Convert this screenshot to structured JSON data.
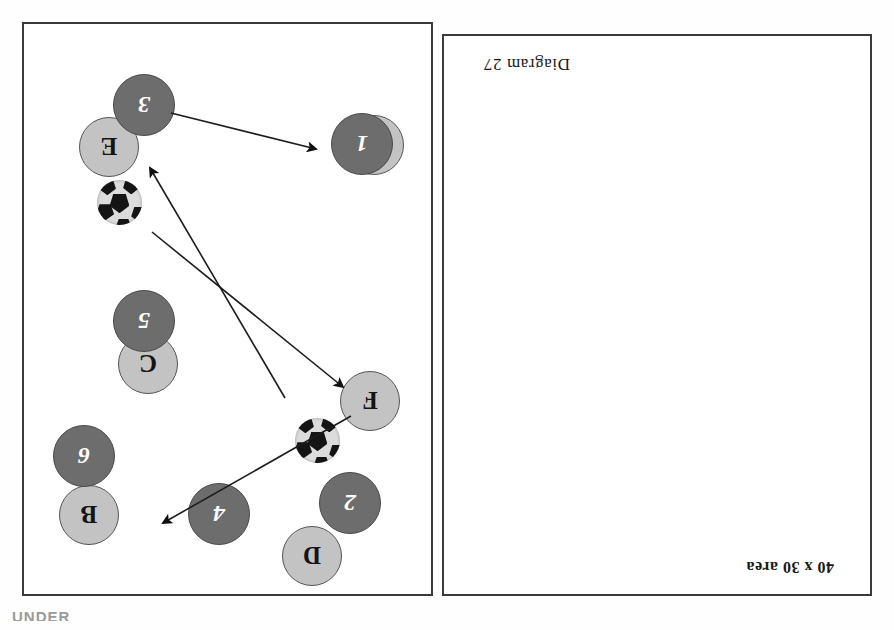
{
  "document": {
    "type": "soccer-coaching-diagram",
    "orientation": "upside-down-scan",
    "page_background": "#ffffff",
    "edge_text_fragment": "UNDER"
  },
  "colors": {
    "dark_player_fill": "#6d6d6d",
    "dark_player_stroke": "#4a4a4a",
    "dark_player_text": "#ffffff",
    "light_player_fill": "#c3c3c3",
    "light_player_stroke": "#555555",
    "light_player_text": "#141414",
    "border": "#3a3a3a",
    "arrow": "#1c1c1c",
    "ball_light": "#dcdcdc",
    "ball_dark": "#141414"
  },
  "captions": {
    "area": "40 x 30 area",
    "diagram": "Diagram 27"
  },
  "panels": [
    {
      "id": "numbered-panel",
      "name": "numbered-players-panel",
      "screen_position": "left",
      "players": [
        {
          "label": "1",
          "x": 40,
          "y": 455,
          "d": 62
        },
        {
          "label": "2",
          "x": 52,
          "y": 96,
          "d": 62
        },
        {
          "label": "3",
          "x": 258,
          "y": 494,
          "d": 62
        },
        {
          "label": "4",
          "x": 183,
          "y": 85,
          "d": 62
        },
        {
          "label": "5",
          "x": 258,
          "y": 278,
          "d": 62
        },
        {
          "label": "6",
          "x": 318,
          "y": 143,
          "d": 62
        }
      ],
      "ball": {
        "x": 93,
        "y": 167,
        "d": 45
      },
      "arrows": [
        {
          "name": "pass-ball-to-space",
          "from": [
            148,
            232
          ],
          "to": [
            288,
            468
          ]
        },
        {
          "name": "run-player3-to-player1",
          "from": [
            262,
            517
          ],
          "to": [
            112,
            480
          ]
        }
      ]
    },
    {
      "id": "lettered-panel",
      "name": "lettered-players-panel",
      "screen_position": "right",
      "players": [
        {
          "label": "A",
          "x": 490,
          "y": 455,
          "d": 60
        },
        {
          "label": "B",
          "x": 775,
          "y": 85,
          "d": 60
        },
        {
          "label": "C",
          "x": 716,
          "y": 236,
          "d": 60
        },
        {
          "label": "D",
          "x": 552,
          "y": 44,
          "d": 60
        },
        {
          "label": "E",
          "x": 755,
          "y": 453,
          "d": 60
        },
        {
          "label": "F",
          "x": 494,
          "y": 199,
          "d": 60
        }
      ],
      "ball": {
        "x": 752,
        "y": 405,
        "d": 45
      },
      "arrows": [
        {
          "name": "pass-F-to-B",
          "from": [
            543,
            214
          ],
          "to": [
            737,
            105
          ]
        },
        {
          "name": "pass-E-to-F",
          "from": [
            742,
            398
          ],
          "to": [
            545,
            237
          ]
        }
      ]
    }
  ]
}
